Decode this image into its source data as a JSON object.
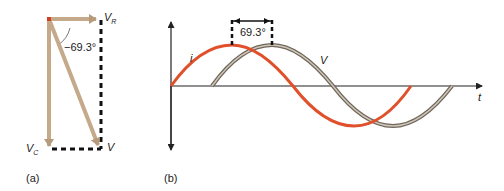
{
  "panel_a": {
    "label": "(a)",
    "phasors": {
      "vr": {
        "name": "V",
        "sub": "R"
      },
      "vc": {
        "name": "V",
        "sub": "C"
      },
      "v": {
        "name": "V"
      }
    },
    "angle_label": "−69.3°"
  },
  "panel_b": {
    "label": "(b)",
    "current_label": "i",
    "voltage_label": "V",
    "time_label": "t",
    "phase_label": "69.3°"
  },
  "colors": {
    "current": "#e0502a",
    "voltage": "#8a8070",
    "phasor": "#c4a98a",
    "axis": "#222222"
  }
}
